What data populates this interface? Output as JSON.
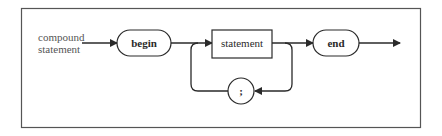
{
  "diagram": {
    "type": "syntax-diagram",
    "start_label_line1": "compound",
    "start_label_line2": "statement",
    "nodes": {
      "begin": {
        "kind": "terminal",
        "label": "begin"
      },
      "statement": {
        "kind": "nonterminal",
        "label": "statement"
      },
      "separator": {
        "kind": "terminal",
        "label": ";"
      },
      "end": {
        "kind": "terminal",
        "label": "end"
      }
    },
    "edges": [
      {
        "from": "start",
        "to": "begin"
      },
      {
        "from": "begin",
        "to": "statement"
      },
      {
        "from": "statement",
        "to": "end"
      },
      {
        "from": "statement",
        "to": "separator"
      },
      {
        "from": "separator",
        "to": "statement"
      },
      {
        "from": "end",
        "to": "exit"
      }
    ],
    "colors": {
      "stroke": "#2a2a2a",
      "frame": "#555555",
      "background": "#ffffff"
    }
  }
}
